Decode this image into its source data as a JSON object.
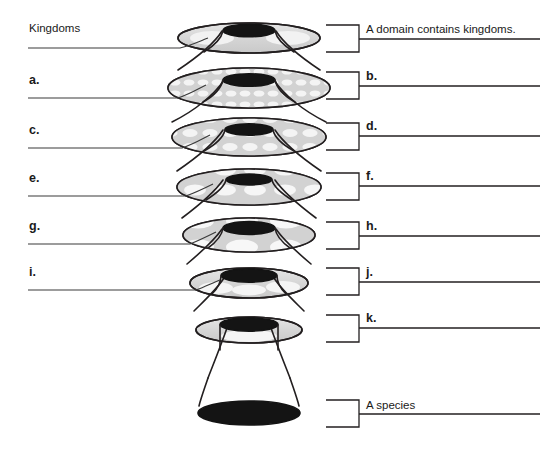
{
  "diagram": {
    "type": "nested-funnel-hierarchy",
    "levels": 8,
    "colors": {
      "ink": "#1a1a1a",
      "stroke": "#231f20",
      "fill_light": "#d9d9d9",
      "fill_cell": "#f2f2f2",
      "fill_dark": "#1a1a1a",
      "page": "#ffffff"
    }
  },
  "left_labels": [
    {
      "id": "kingdoms",
      "text": "Kingdoms",
      "style": "plain"
    },
    {
      "id": "a",
      "text": "a.",
      "style": "letter"
    },
    {
      "id": "c",
      "text": "c.",
      "style": "letter"
    },
    {
      "id": "e",
      "text": "e.",
      "style": "letter"
    },
    {
      "id": "g",
      "text": "g.",
      "style": "letter"
    },
    {
      "id": "i",
      "text": "i.",
      "style": "letter"
    }
  ],
  "right_labels": [
    {
      "id": "domain",
      "text": "A domain contains kingdoms.",
      "style": "plain"
    },
    {
      "id": "b",
      "text": "b.",
      "style": "letter"
    },
    {
      "id": "d",
      "text": "d.",
      "style": "letter"
    },
    {
      "id": "f",
      "text": "f.",
      "style": "letter"
    },
    {
      "id": "h",
      "text": "h.",
      "style": "letter"
    },
    {
      "id": "j",
      "text": "j.",
      "style": "letter"
    },
    {
      "id": "k",
      "text": "k.",
      "style": "letter"
    },
    {
      "id": "species",
      "text": "A species",
      "style": "plain"
    }
  ]
}
